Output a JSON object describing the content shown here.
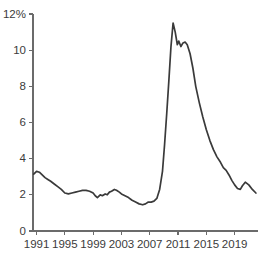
{
  "chart_data": {
    "type": "line",
    "title": "",
    "subtitle": "",
    "xlabel": "",
    "ylabel": "",
    "xlim": [
      1990.5,
      2022.3
    ],
    "ylim": [
      0,
      12
    ],
    "grid": false,
    "legend": null,
    "y_tick_labels": [
      "12%",
      "10",
      "8",
      "6",
      "4",
      "2",
      "0"
    ],
    "y_tick_values": [
      12,
      10,
      8,
      6,
      4,
      2,
      0
    ],
    "x_tick_labels": [
      "1991",
      "1995",
      "1999",
      "2003",
      "2007",
      "2011",
      "2015",
      "2019"
    ],
    "x_tick_values": [
      1991,
      1995,
      1999,
      2003,
      2007,
      2011,
      2015,
      2019
    ],
    "line_color": "#3a3a3a",
    "axis_color": "#6b6b6b",
    "background_color": "#ffffff",
    "series": [
      {
        "name": "rate",
        "x": [
          1990.6,
          1991.0,
          1991.4,
          1991.8,
          1992.2,
          1992.6,
          1993.0,
          1993.5,
          1994.0,
          1994.5,
          1995.0,
          1995.5,
          1996.0,
          1996.5,
          1997.0,
          1997.5,
          1998.0,
          1998.5,
          1999.0,
          1999.3,
          1999.6,
          2000.0,
          2000.3,
          2000.7,
          2001.0,
          2001.3,
          2001.6,
          2002.0,
          2002.3,
          2002.7,
          2003.0,
          2003.5,
          2004.0,
          2004.5,
          2005.0,
          2005.5,
          2006.0,
          2006.4,
          2006.8,
          2007.2,
          2007.6,
          2008.0,
          2008.4,
          2008.8,
          2009.1,
          2009.4,
          2009.7,
          2010.0,
          2010.3,
          2010.6,
          2010.9,
          2011.1,
          2011.4,
          2011.7,
          2012.0,
          2012.3,
          2012.7,
          2013.1,
          2013.5,
          2014.0,
          2014.5,
          2015.0,
          2015.5,
          2016.0,
          2016.5,
          2017.0,
          2017.4,
          2017.8,
          2018.2,
          2018.6,
          2019.0,
          2019.4,
          2019.8,
          2020.1,
          2020.5,
          2021.0,
          2021.5,
          2022.0
        ],
        "y": [
          3.15,
          3.3,
          3.25,
          3.1,
          2.95,
          2.85,
          2.75,
          2.6,
          2.45,
          2.3,
          2.1,
          2.05,
          2.1,
          2.15,
          2.2,
          2.25,
          2.25,
          2.2,
          2.1,
          1.95,
          1.85,
          2.0,
          1.95,
          2.05,
          2.0,
          2.15,
          2.2,
          2.3,
          2.25,
          2.15,
          2.05,
          1.95,
          1.85,
          1.7,
          1.6,
          1.5,
          1.45,
          1.5,
          1.6,
          1.6,
          1.65,
          1.8,
          2.3,
          3.3,
          4.8,
          6.5,
          8.3,
          10.2,
          11.5,
          11.0,
          10.3,
          10.5,
          10.2,
          10.4,
          10.45,
          10.3,
          9.8,
          9.0,
          8.0,
          7.1,
          6.3,
          5.6,
          5.0,
          4.5,
          4.1,
          3.8,
          3.5,
          3.35,
          3.1,
          2.8,
          2.55,
          2.35,
          2.3,
          2.5,
          2.7,
          2.55,
          2.3,
          2.1
        ]
      }
    ]
  }
}
